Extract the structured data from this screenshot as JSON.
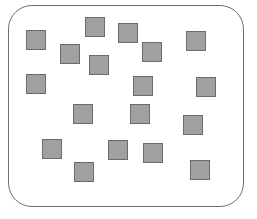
{
  "figure": {
    "name": "random-square-distribution",
    "canvas": {
      "width": 257,
      "height": 219,
      "background": "#ffffff"
    },
    "container": {
      "label": "rounded-rectangle-boundary",
      "x": 8,
      "y": 5,
      "width": 236,
      "height": 202,
      "corner_radius": 24,
      "border_color": "#6e6e6e",
      "border_width": 1,
      "fill": "#ffffff"
    },
    "particle_style": {
      "fill": "#a0a0a0",
      "border_color": "#6b6b6b",
      "border_width": 1,
      "shape": "square"
    },
    "particle_count": 17,
    "particles": [
      {
        "id": 1,
        "x": 85,
        "y": 17,
        "size": 20
      },
      {
        "id": 2,
        "x": 26,
        "y": 30,
        "size": 20
      },
      {
        "id": 3,
        "x": 118,
        "y": 23,
        "size": 20
      },
      {
        "id": 4,
        "x": 186,
        "y": 31,
        "size": 20
      },
      {
        "id": 5,
        "x": 60,
        "y": 44,
        "size": 20
      },
      {
        "id": 6,
        "x": 142,
        "y": 42,
        "size": 20
      },
      {
        "id": 7,
        "x": 89,
        "y": 55,
        "size": 20
      },
      {
        "id": 8,
        "x": 26,
        "y": 74,
        "size": 20
      },
      {
        "id": 9,
        "x": 133,
        "y": 76,
        "size": 20
      },
      {
        "id": 10,
        "x": 196,
        "y": 77,
        "size": 20
      },
      {
        "id": 11,
        "x": 73,
        "y": 104,
        "size": 20
      },
      {
        "id": 12,
        "x": 130,
        "y": 104,
        "size": 20
      },
      {
        "id": 13,
        "x": 183,
        "y": 115,
        "size": 20
      },
      {
        "id": 14,
        "x": 42,
        "y": 139,
        "size": 20
      },
      {
        "id": 15,
        "x": 108,
        "y": 140,
        "size": 20
      },
      {
        "id": 16,
        "x": 143,
        "y": 143,
        "size": 20
      },
      {
        "id": 17,
        "x": 74,
        "y": 162,
        "size": 20
      },
      {
        "id": 18,
        "x": 190,
        "y": 160,
        "size": 20
      }
    ]
  }
}
